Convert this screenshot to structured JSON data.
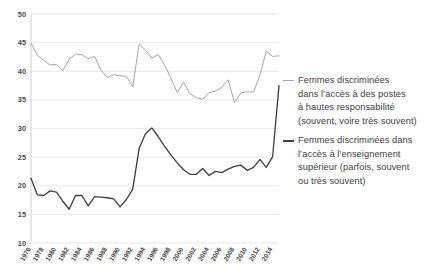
{
  "chart_data": {
    "type": "line",
    "title": "",
    "xlabel": "",
    "ylabel": "",
    "ylim": [
      10,
      50
    ],
    "ytick_step": 5,
    "yticks": [
      10,
      15,
      20,
      25,
      30,
      35,
      40,
      45,
      50
    ],
    "grid": true,
    "legend_position": "right",
    "xtick_labels": [
      "1976",
      "1978",
      "1980",
      "1982",
      "1984",
      "1986",
      "1988",
      "1990",
      "1992",
      "1994",
      "1996",
      "1998",
      "2000",
      "2002",
      "2004",
      "2006",
      "2008",
      "2010",
      "2012",
      "2014"
    ],
    "x": [
      1976,
      1977,
      1978,
      1979,
      1980,
      1981,
      1982,
      1983,
      1984,
      1985,
      1986,
      1987,
      1988,
      1989,
      1990,
      1991,
      1992,
      1993,
      1994,
      1995,
      1996,
      1997,
      1998,
      1999,
      2000,
      2001,
      2002,
      2003,
      2004,
      2005,
      2006,
      2007,
      2008,
      2009,
      2010,
      2011,
      2012,
      2013,
      2014,
      2015
    ],
    "series": [
      {
        "name": "Femmes discriminées dans l'accès à des postes à hautes responsabilité (souvent, voire très souvent)",
        "color": "#a6a6a6",
        "values": [
          44.9,
          42.8,
          41.9,
          41.1,
          41.2,
          40.1,
          42.1,
          43.0,
          42.9,
          42.2,
          42.6,
          40.2,
          38.9,
          39.4,
          39.2,
          39.1,
          37.3,
          44.7,
          43.7,
          42.3,
          42.9,
          41.1,
          38.8,
          36.3,
          38.1,
          36.1,
          35.4,
          35.1,
          36.3,
          36.5,
          37.2,
          38.5,
          34.5,
          36.2,
          36.4,
          36.4,
          39.3,
          43.5,
          42.6,
          42.7
        ]
      },
      {
        "name": "Femmes discriminées dans l'accès à l'enseignement supérieur (parfois, souvent ou très souvent)",
        "color": "#404040",
        "values": [
          21.3,
          18.4,
          18.3,
          19.1,
          18.9,
          17.3,
          15.9,
          18.3,
          18.3,
          16.5,
          18.1,
          18.0,
          17.9,
          17.7,
          16.3,
          17.6,
          19.4,
          26.5,
          29.1,
          30.1,
          28.6,
          26.9,
          25.4,
          24.0,
          22.8,
          22.0,
          22.0,
          23.0,
          21.8,
          22.5,
          22.3,
          22.9,
          23.4,
          23.6,
          22.7,
          23.2,
          24.6,
          23.2,
          25.1,
          37.5
        ]
      }
    ]
  },
  "legend": {
    "entries": [
      {
        "marker": "light-dash-icon",
        "text": "Femmes discriminées\ndans l’accès à des postes\nà hautes responsabilité\n(souvent, voire très souvent)"
      },
      {
        "marker": "dark-dash-icon",
        "text": "Femmes discriminées dans\nl’accès à l’enseignement\nsupérieur (parfois, souvent\nou très souvent)"
      }
    ]
  }
}
